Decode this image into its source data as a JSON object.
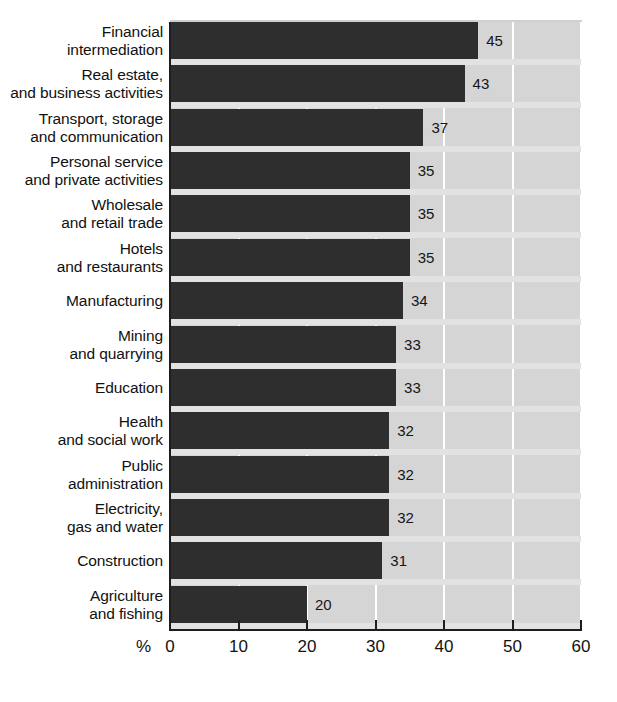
{
  "chart_data": {
    "type": "bar",
    "orientation": "horizontal",
    "title": "",
    "subtitle": "",
    "xlabel": "%",
    "ylabel": "",
    "xlim": [
      0,
      60
    ],
    "xticks": [
      "0",
      "10",
      "20",
      "30",
      "40",
      "50",
      "60"
    ],
    "grid": true,
    "legend": null,
    "categories": [
      "Financial\nintermediation",
      "Real estate,\nand business activities",
      "Transport, storage\nand communication",
      "Personal service\nand private activities",
      "Wholesale\nand retail trade",
      "Hotels\nand restaurants",
      "Manufacturing",
      "Mining\nand quarrying",
      "Education",
      "Health\nand social work",
      "Public\nadministration",
      "Electricity,\ngas and water",
      "Construction",
      "Agriculture\nand fishing"
    ],
    "values": [
      45,
      43,
      37,
      35,
      35,
      35,
      34,
      33,
      33,
      32,
      32,
      32,
      31,
      20
    ],
    "value_labels": [
      "45",
      "43",
      "37",
      "35",
      "35",
      "35",
      "34",
      "33",
      "33",
      "32",
      "32",
      "32",
      "31",
      "20"
    ],
    "colors": {
      "bar": "#2e2e2e",
      "plot_background": "#d5d5d5",
      "gridline": "#ffffff",
      "axis": "#1d1d1d",
      "text": "#111111",
      "page_background": "#ffffff"
    }
  }
}
